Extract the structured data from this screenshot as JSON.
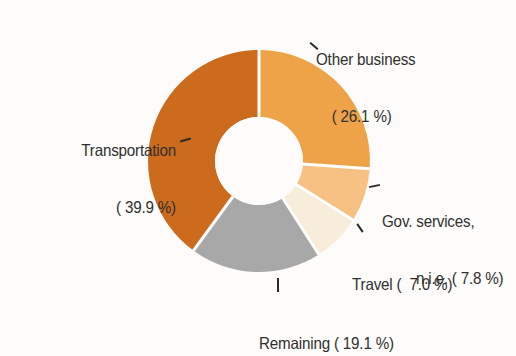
{
  "chart_data": {
    "type": "pie",
    "variant": "donut",
    "title": "",
    "subtitle": "",
    "xlabel": "",
    "ylabel": "",
    "legend_position": "none",
    "grid": false,
    "value_unit": "%",
    "total": 99.9,
    "start_angle_deg": 0,
    "direction": "clockwise",
    "inner_radius_ratio": 0.4,
    "categories": [
      "Other business",
      "Gov. services, n.i.e.",
      "Travel",
      "Remaining",
      "Transportation"
    ],
    "values": [
      26.1,
      7.8,
      7.0,
      19.1,
      39.9
    ],
    "colors": [
      "#efa349",
      "#f7c183",
      "#f7edda",
      "#a8a8a8",
      "#cc6a1e"
    ],
    "slices": [
      {
        "name": "Other business",
        "value": 26.1,
        "color": "#efa349",
        "label_line1": "Other business",
        "label_line2": "( 26.1 %)"
      },
      {
        "name": "Gov. services, n.i.e.",
        "value": 7.8,
        "color": "#f7c183",
        "label_line1": "Gov. services,",
        "label_line2": "n.i.e. ( 7.8 %)"
      },
      {
        "name": "Travel",
        "value": 7.0,
        "color": "#f7edda",
        "label_line1": "Travel (  7.0 %)",
        "label_line2": ""
      },
      {
        "name": "Remaining",
        "value": 19.1,
        "color": "#a8a8a8",
        "label_line1": "Remaining ( 19.1 %)",
        "label_line2": ""
      },
      {
        "name": "Transportation",
        "value": 39.9,
        "color": "#cc6a1e",
        "label_line1": "Transportation",
        "label_line2": "( 39.9 %)"
      }
    ]
  },
  "style": {
    "background_color": "#fdfcfa",
    "separator_color": "#ffffff",
    "text_color": "#2f2f2f",
    "hole_color": "#fdfcfa"
  },
  "geometry": {
    "center_x": 259,
    "center_y": 161,
    "outer_radius": 111,
    "inner_radius": 44
  }
}
